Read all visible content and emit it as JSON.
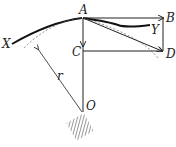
{
  "diagram": {
    "labels": {
      "A": "A",
      "B": "B",
      "C": "C",
      "D": "D",
      "X": "X",
      "Y": "Y",
      "O": "O",
      "r": "r"
    },
    "colors": {
      "ink": "#222222",
      "hatch": "#333333"
    }
  }
}
